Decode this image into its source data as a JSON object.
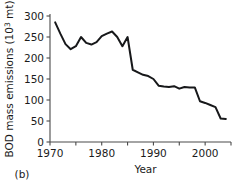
{
  "chart_data": {
    "type": "line",
    "title": "",
    "panel_label": "(b)",
    "xlabel": "Year",
    "ylabel": "BOD mass emissions (10³ mt)",
    "ylabel_base": "BOD mass emissions (10",
    "ylabel_exp": "3",
    "ylabel_tail": " mt)",
    "xlim": [
      1970,
      2005
    ],
    "ylim": [
      0,
      300
    ],
    "grid": false,
    "legend": "none",
    "line_color": "#17181a",
    "axis_color": "#4a4a4a",
    "ytick_labels": [
      "0",
      "50",
      "100",
      "150",
      "200",
      "250",
      "300"
    ],
    "ytick_values": [
      0,
      50,
      100,
      150,
      200,
      250,
      300
    ],
    "xtick_labels": [
      "1970",
      "1980",
      "1990",
      "2000"
    ],
    "xtick_values": [
      1970,
      1980,
      1990,
      2000
    ],
    "xtick_minor_values": [
      1975,
      1985,
      1995,
      2005
    ],
    "x": [
      1971,
      1972,
      1973,
      1974,
      1975,
      1976,
      1977,
      1978,
      1979,
      1980,
      1981,
      1982,
      1983,
      1984,
      1985,
      1986,
      1987,
      1988,
      1989,
      1990,
      1991,
      1992,
      1993,
      1994,
      1995,
      1996,
      1997,
      1998,
      1999,
      2000,
      2001,
      2002,
      2003,
      2004
    ],
    "values": [
      285,
      258,
      233,
      221,
      228,
      250,
      236,
      232,
      238,
      252,
      258,
      263,
      250,
      228,
      250,
      172,
      166,
      160,
      157,
      150,
      134,
      132,
      131,
      133,
      127,
      131,
      130,
      130,
      97,
      93,
      88,
      83,
      56,
      55
    ],
    "series": [
      {
        "name": "BOD mass emissions",
        "values": [
          285,
          258,
          233,
          221,
          228,
          250,
          236,
          232,
          238,
          252,
          258,
          263,
          250,
          228,
          250,
          172,
          166,
          160,
          157,
          150,
          134,
          132,
          131,
          133,
          127,
          131,
          130,
          130,
          97,
          93,
          88,
          83,
          56,
          55
        ]
      }
    ]
  }
}
